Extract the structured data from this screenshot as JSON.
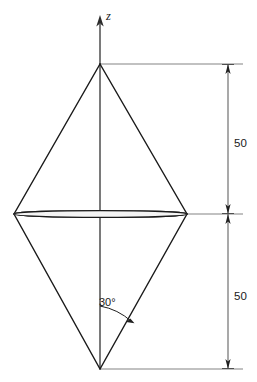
{
  "figure": {
    "kind": "technical-line-drawing",
    "background_color": "#ffffff",
    "line_color": "#1a1a1a",
    "width": 257,
    "height": 382
  },
  "axis": {
    "name": "z-axis",
    "label": "z",
    "label_style": "italic",
    "arrow_direction": "up",
    "x": 100,
    "tip_y": 17,
    "base_y": 369
  },
  "geometry": {
    "apex_top": {
      "x": 100,
      "y": 64
    },
    "apex_bottom": {
      "x": 100,
      "y": 369
    },
    "equator_left": {
      "x": 14,
      "y": 214
    },
    "equator_right": {
      "x": 187,
      "y": 214
    },
    "equator_band": {
      "center_x": 100.5,
      "center_y": 214,
      "radius_x": 86.5,
      "radius_y": 3.2,
      "hatched": true,
      "hatch_count": 46
    }
  },
  "dimensions": [
    {
      "id": "upper-half-height",
      "label": "50",
      "from_y": 64,
      "to_y": 214,
      "line_x": 228,
      "label_x": 240,
      "label_y": 143,
      "extension_from_x": 100,
      "extension_to_x": 243
    },
    {
      "id": "lower-half-height",
      "label": "50",
      "from_y": 214,
      "to_y": 369,
      "line_x": 228,
      "label_x": 240,
      "label_y": 296,
      "extension_from_x": 100,
      "extension_to_x": 243
    }
  ],
  "annotations": [
    {
      "id": "apex-angle",
      "label": "30°",
      "label_x": 99,
      "label_y": 305,
      "vertex": {
        "x": 100,
        "y": 369
      },
      "arc_start": {
        "x": 100,
        "y": 305
      },
      "arc_end": {
        "x": 132,
        "y": 322
      },
      "description": "half-angle between the z-axis and the lower lateral edge"
    }
  ],
  "colors": {
    "stroke": "#1a1a1a",
    "dimension_stroke": "#4a4a4a",
    "extension_stroke": "#6e6e6e",
    "band_fill": "#f4f4f4",
    "background": "#ffffff"
  }
}
